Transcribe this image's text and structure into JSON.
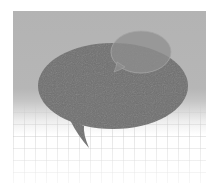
{
  "image": {
    "description": "Two overlapping speech bubbles on a gray-to-white gradient background with a faint grid",
    "colors": {
      "background_top": "#b3b3b3",
      "background_bottom": "#ffffff",
      "large_bubble": "#6f6f6f",
      "small_bubble": "#8c8c8c",
      "grid_line": "#c8c8c8"
    },
    "elements": [
      {
        "name": "large-speech-bubble",
        "tail": "bottom-left"
      },
      {
        "name": "small-speech-bubble",
        "tail": "bottom-left",
        "opacity": "semi-transparent"
      }
    ]
  }
}
